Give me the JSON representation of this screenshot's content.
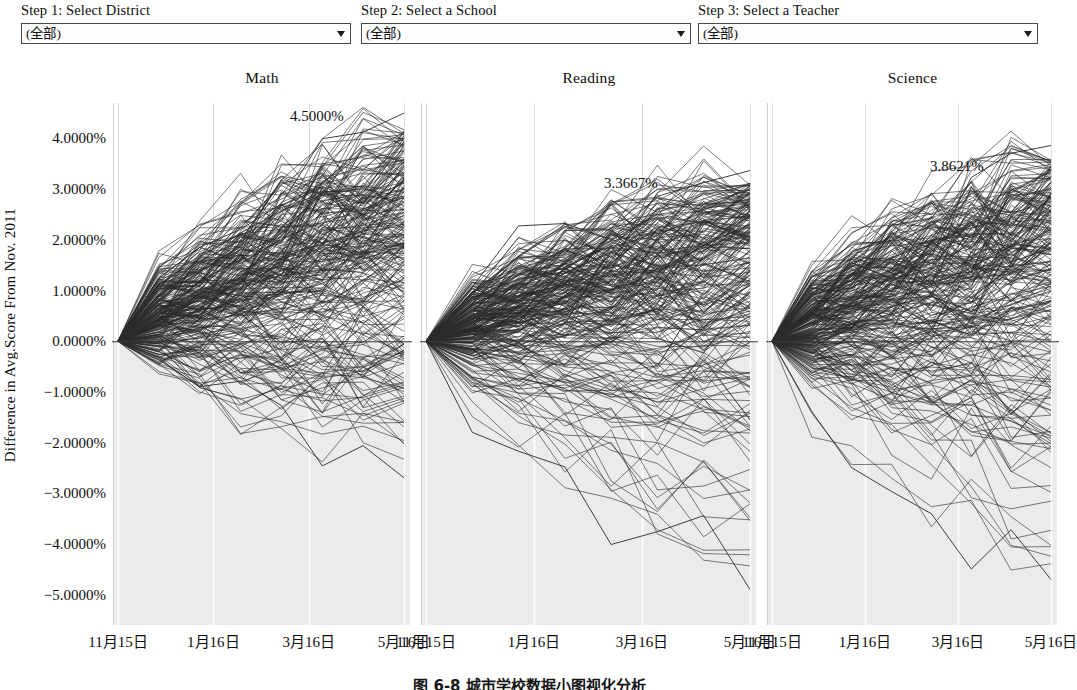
{
  "filters": {
    "district": {
      "label": "Step 1: Select District",
      "value": "(全部)",
      "arrow_icon": "chevron-down-icon"
    },
    "school": {
      "label": "Step 2: Select a School",
      "value": "(全部)",
      "arrow_icon": "chevron-down-icon"
    },
    "teacher": {
      "label": "Step 3: Select a Teacher",
      "value": "(全部)",
      "arrow_icon": "chevron-down-icon"
    }
  },
  "caption": "图 6-8  城市学校数据小图视化分析",
  "chart_data": {
    "type": "line",
    "title": "",
    "ylabel": "Difference in Avg.Score From Nov. 2011",
    "xlabel": "",
    "ylim": [
      -5.6,
      4.7
    ],
    "yticks": [
      "4.0000%",
      "3.0000%",
      "2.0000%",
      "1.0000%",
      "0.0000%",
      "-1.0000%",
      "-2.0000%",
      "-3.0000%",
      "-4.0000%",
      "-5.0000%"
    ],
    "ytick_values": [
      4.0,
      3.0,
      2.0,
      1.0,
      0.0,
      -1.0,
      -2.0,
      -3.0,
      -4.0,
      -5.0
    ],
    "xticks": [
      "11月15日",
      "1月16日",
      "3月16日",
      "5月16日"
    ],
    "grid": true,
    "legend": "none",
    "line_color": "#2b2b2b",
    "series_count_per_panel": 260,
    "panels": [
      {
        "name": "Math",
        "annotation": "4.5000%",
        "max_value": 4.5,
        "min_value": -2.75,
        "seed": 17
      },
      {
        "name": "Reading",
        "annotation": "3.3667%",
        "max_value": 3.3667,
        "min_value": -5.0,
        "seed": 43
      },
      {
        "name": "Science",
        "annotation": "3.8621%",
        "max_value": 3.8621,
        "min_value": -4.8,
        "seed": 91
      }
    ]
  }
}
